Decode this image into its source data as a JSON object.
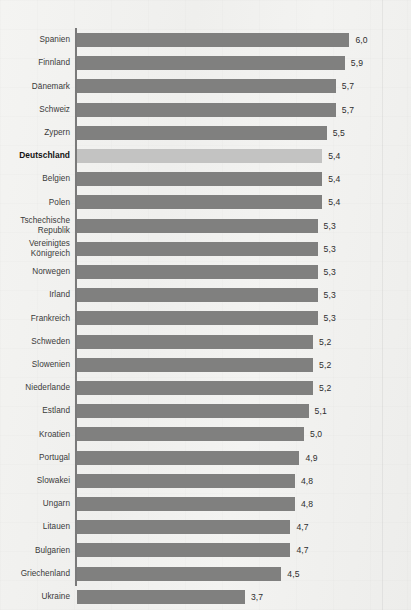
{
  "chart_data": {
    "type": "bar",
    "orientation": "horizontal",
    "title": "",
    "subtitle": "",
    "xlabel": "",
    "ylabel": "",
    "xlim": [
      0,
      6.3
    ],
    "grid": false,
    "legend": null,
    "value_format": "comma-decimal",
    "categories": [
      "Spanien",
      "Finnland",
      "Dänemark",
      "Schweiz",
      "Zypern",
      "Deutschland",
      "Belgien",
      "Polen",
      "Tschechische Republik",
      "Vereinigtes Königreich",
      "Norwegen",
      "Irland",
      "Frankreich",
      "Schweden",
      "Slowenien",
      "Niederlande",
      "Estland",
      "Kroatien",
      "Portugal",
      "Slowakei",
      "Ungarn",
      "Litauen",
      "Bulgarien",
      "Griechenland",
      "Ukraine"
    ],
    "values": [
      6.0,
      5.9,
      5.7,
      5.7,
      5.5,
      5.4,
      5.4,
      5.4,
      5.3,
      5.3,
      5.3,
      5.3,
      5.3,
      5.2,
      5.2,
      5.2,
      5.1,
      5.0,
      4.9,
      4.8,
      4.8,
      4.7,
      4.7,
      4.5,
      3.7
    ],
    "value_labels": [
      "6,0",
      "5,9",
      "5,7",
      "5,7",
      "5,5",
      "5,4",
      "5,4",
      "5,4",
      "5,3",
      "5,3",
      "5,3",
      "5,3",
      "5,3",
      "5,2",
      "5,2",
      "5,2",
      "5,1",
      "5,0",
      "4,9",
      "4,8",
      "4,8",
      "4,7",
      "4,7",
      "4,5",
      "3,7"
    ],
    "highlighted_category": "Deutschland",
    "colors": {
      "bar": "#80807f",
      "bar_highlight": "#c3c3c2",
      "axis": "#7a7a7a",
      "label_text": "#3a3a3a",
      "value_text": "#2e2e2e",
      "background": "#f2f2f0"
    }
  },
  "rows": [
    {
      "label_lines": [
        "Spanien"
      ],
      "value_label": "6,0",
      "value": 6.0,
      "highlight": false
    },
    {
      "label_lines": [
        "Finnland"
      ],
      "value_label": "5,9",
      "value": 5.9,
      "highlight": false
    },
    {
      "label_lines": [
        "Dänemark"
      ],
      "value_label": "5,7",
      "value": 5.7,
      "highlight": false
    },
    {
      "label_lines": [
        "Schweiz"
      ],
      "value_label": "5,7",
      "value": 5.7,
      "highlight": false
    },
    {
      "label_lines": [
        "Zypern"
      ],
      "value_label": "5,5",
      "value": 5.5,
      "highlight": false
    },
    {
      "label_lines": [
        "Deutschland"
      ],
      "value_label": "5,4",
      "value": 5.4,
      "highlight": true
    },
    {
      "label_lines": [
        "Belgien"
      ],
      "value_label": "5,4",
      "value": 5.4,
      "highlight": false
    },
    {
      "label_lines": [
        "Polen"
      ],
      "value_label": "5,4",
      "value": 5.4,
      "highlight": false
    },
    {
      "label_lines": [
        "Tschechische",
        "Republik"
      ],
      "value_label": "5,3",
      "value": 5.3,
      "highlight": false
    },
    {
      "label_lines": [
        "Vereinigtes",
        "Königreich"
      ],
      "value_label": "5,3",
      "value": 5.3,
      "highlight": false
    },
    {
      "label_lines": [
        "Norwegen"
      ],
      "value_label": "5,3",
      "value": 5.3,
      "highlight": false
    },
    {
      "label_lines": [
        "Irland"
      ],
      "value_label": "5,3",
      "value": 5.3,
      "highlight": false
    },
    {
      "label_lines": [
        "Frankreich"
      ],
      "value_label": "5,3",
      "value": 5.3,
      "highlight": false
    },
    {
      "label_lines": [
        "Schweden"
      ],
      "value_label": "5,2",
      "value": 5.2,
      "highlight": false
    },
    {
      "label_lines": [
        "Slowenien"
      ],
      "value_label": "5,2",
      "value": 5.2,
      "highlight": false
    },
    {
      "label_lines": [
        "Niederlande"
      ],
      "value_label": "5,2",
      "value": 5.2,
      "highlight": false
    },
    {
      "label_lines": [
        "Estland"
      ],
      "value_label": "5,1",
      "value": 5.1,
      "highlight": false
    },
    {
      "label_lines": [
        "Kroatien"
      ],
      "value_label": "5,0",
      "value": 5.0,
      "highlight": false
    },
    {
      "label_lines": [
        "Portugal"
      ],
      "value_label": "4,9",
      "value": 4.9,
      "highlight": false
    },
    {
      "label_lines": [
        "Slowakei"
      ],
      "value_label": "4,8",
      "value": 4.8,
      "highlight": false
    },
    {
      "label_lines": [
        "Ungarn"
      ],
      "value_label": "4,8",
      "value": 4.8,
      "highlight": false
    },
    {
      "label_lines": [
        "Litauen"
      ],
      "value_label": "4,7",
      "value": 4.7,
      "highlight": false
    },
    {
      "label_lines": [
        "Bulgarien"
      ],
      "value_label": "4,7",
      "value": 4.7,
      "highlight": false
    },
    {
      "label_lines": [
        "Griechenland"
      ],
      "value_label": "4,5",
      "value": 4.5,
      "highlight": false
    },
    {
      "label_lines": [
        "Ukraine"
      ],
      "value_label": "3,7",
      "value": 3.7,
      "highlight": false
    }
  ]
}
